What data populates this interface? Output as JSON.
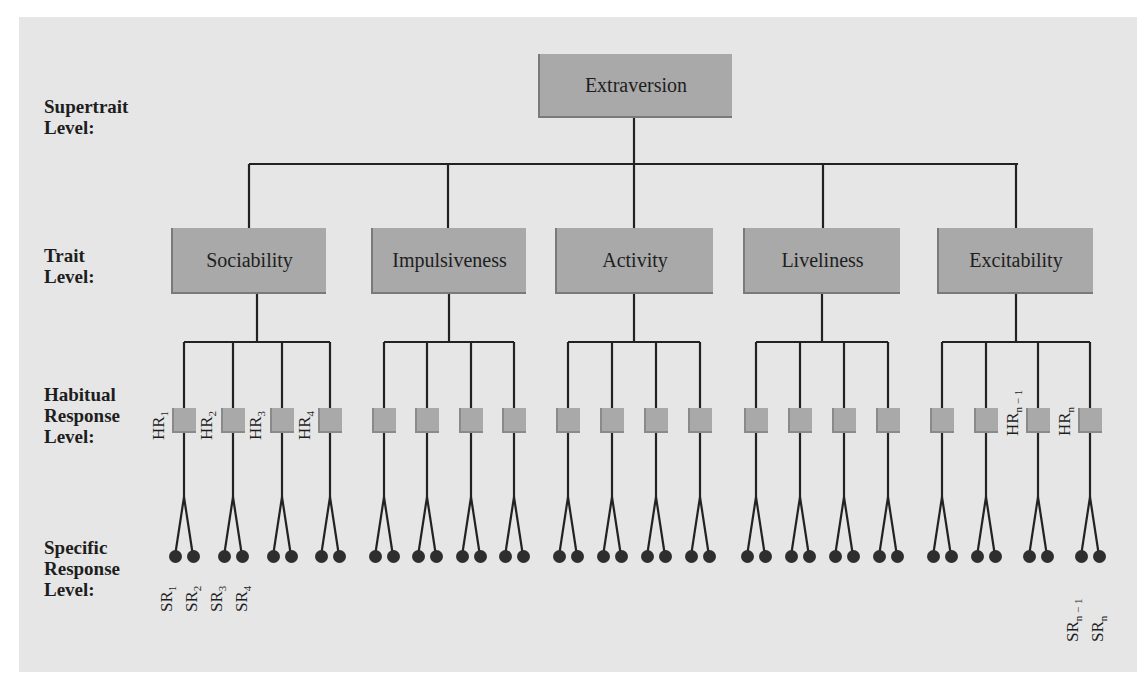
{
  "level_labels": {
    "supertrait": [
      "Supertrait",
      "Level:"
    ],
    "trait": [
      "Trait",
      "Level:"
    ],
    "habitual": [
      "Habitual",
      "Response",
      "Level:"
    ],
    "specific": [
      "Specific",
      "Response",
      "Level:"
    ]
  },
  "supertrait": {
    "label": "Extraversion"
  },
  "traits": [
    {
      "label": "Sociability"
    },
    {
      "label": "Impulsiveness"
    },
    {
      "label": "Activity"
    },
    {
      "label": "Liveliness"
    },
    {
      "label": "Excitability"
    }
  ],
  "habitual_labels": {
    "hr1": "HR",
    "hr1_sub": "1",
    "hr2": "HR",
    "hr2_sub": "2",
    "hr3": "HR",
    "hr3_sub": "3",
    "hr4": "HR",
    "hr4_sub": "4",
    "hrn1": "HR",
    "hrn1_sub": "n − 1",
    "hrn": "HR",
    "hrn_sub": "n"
  },
  "specific_labels": {
    "sr1": "SR",
    "sr1_sub": "1",
    "sr2": "SR",
    "sr2_sub": "2",
    "sr3": "SR",
    "sr3_sub": "3",
    "sr4": "SR",
    "sr4_sub": "4",
    "srn1": "SR",
    "srn1_sub": "n − 1",
    "srn": "SR",
    "srn_sub": "n"
  },
  "colors": {
    "panel": "#e6e6e6",
    "box_fill": "#a9a9a9",
    "line": "#222222",
    "dot": "#2e2e2e"
  }
}
